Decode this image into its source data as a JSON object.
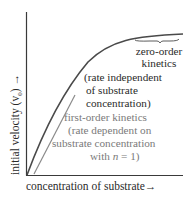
{
  "figure": {
    "y_axis_label": "initial velocity (v",
    "y_axis_label_sub": "0",
    "y_axis_label_end": ") →",
    "x_axis_label": "concentration of substrate→",
    "zero_order": {
      "line1": "zero-order",
      "line2": "kinetics",
      "line3": "(rate independent",
      "line4": "of substrate",
      "line5": "concentration)"
    },
    "first_order": {
      "line1": "first-order  kinetics",
      "line2": "(rate dependent on",
      "line3": "substrate  concentration",
      "line4_pre": "with ",
      "line4_var": "n",
      "line4_post": " = 1)"
    },
    "colors": {
      "curve": "#4a4a4a",
      "first_order_line": "#8a8a8a",
      "axis": "#3a3a3a"
    }
  }
}
